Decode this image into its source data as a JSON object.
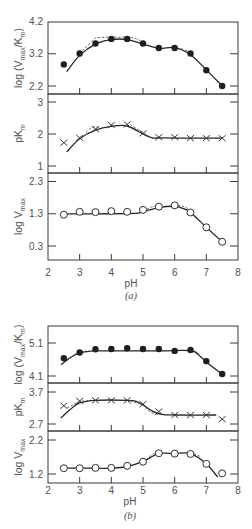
{
  "chart_data": [
    {
      "type": "line",
      "figure_label": "(a)",
      "xlabel": "pH",
      "xlim": [
        2,
        8
      ],
      "xticks": [
        2,
        3,
        4,
        5,
        6,
        7,
        8
      ],
      "grid": false,
      "x": [
        2.5,
        3,
        3.5,
        4,
        4.5,
        5,
        5.5,
        6,
        6.5,
        7,
        7.5
      ],
      "panels": [
        {
          "key": "log-vmax-km",
          "ylabel": "log (Vmax/Km)",
          "ylabel_parts": [
            [
              "log (V",
              0
            ],
            [
              "max",
              1
            ],
            [
              "/K",
              0
            ],
            [
              "m",
              1
            ],
            [
              ")",
              0
            ]
          ],
          "yticks": [
            2.2,
            3.2,
            4.2
          ],
          "marker": "filled-circle",
          "values": [
            2.87,
            3.21,
            3.52,
            3.66,
            3.66,
            3.52,
            3.38,
            3.38,
            3.21,
            2.69,
            2.2
          ],
          "fit_solid": [
            [
              2.6,
              2.66
            ],
            [
              3.0,
              3.15
            ],
            [
              3.5,
              3.5
            ],
            [
              4.0,
              3.64
            ],
            [
              4.5,
              3.64
            ],
            [
              5.0,
              3.5
            ],
            [
              5.5,
              3.37
            ],
            [
              6.0,
              3.39
            ],
            [
              6.5,
              3.17
            ],
            [
              7.0,
              2.7
            ],
            [
              7.5,
              2.2
            ]
          ],
          "fit_dashed": [
            [
              [
                3.0,
                3.2
              ],
              [
                3.4,
                3.6
              ],
              [
                3.6,
                3.7
              ],
              [
                4.5,
                3.71
              ],
              [
                4.8,
                3.66
              ],
              [
                5.0,
                3.55
              ]
            ],
            [
              [
                6.2,
                3.36
              ],
              [
                6.45,
                3.27
              ],
              [
                6.6,
                3.17
              ]
            ]
          ]
        },
        {
          "key": "pkm",
          "ylabel": "pKm",
          "ylabel_parts": [
            [
              "pK",
              0
            ],
            [
              "m",
              1
            ]
          ],
          "yticks": [
            1,
            2,
            3
          ],
          "marker": "cross",
          "values": [
            1.73,
            1.88,
            2.15,
            2.28,
            2.3,
            2.02,
            1.9,
            1.9,
            1.87,
            1.87,
            1.87
          ],
          "fit_solid": [
            [
              2.6,
              1.45
            ],
            [
              3.0,
              1.85
            ],
            [
              3.5,
              2.12
            ],
            [
              4.0,
              2.24
            ],
            [
              4.5,
              2.25
            ],
            [
              5.0,
              2.0
            ],
            [
              5.3,
              1.88
            ],
            [
              5.6,
              1.88
            ],
            [
              6.5,
              1.87
            ],
            [
              7.5,
              1.87
            ]
          ],
          "fit_dashed": [
            [
              [
                3.2,
                2.05
              ],
              [
                3.4,
                2.22
              ],
              [
                3.6,
                2.2
              ]
            ],
            [
              [
                4.6,
                2.3
              ],
              [
                4.8,
                2.16
              ],
              [
                5.0,
                2.05
              ],
              [
                5.2,
                1.92
              ],
              [
                5.35,
                1.85
              ],
              [
                5.5,
                1.88
              ]
            ]
          ]
        },
        {
          "key": "log-vmax",
          "ylabel": "log Vmax",
          "ylabel_parts": [
            [
              "log V",
              0
            ],
            [
              "max",
              1
            ]
          ],
          "yticks": [
            0.3,
            1.3,
            2.3
          ],
          "marker": "open-circle",
          "values": [
            1.27,
            1.36,
            1.35,
            1.38,
            1.36,
            1.42,
            1.52,
            1.56,
            1.34,
            0.88,
            0.43
          ],
          "fit_solid": [
            [
              2.5,
              1.3
            ],
            [
              3.5,
              1.3
            ],
            [
              4.7,
              1.31
            ],
            [
              5.0,
              1.36
            ],
            [
              5.5,
              1.49
            ],
            [
              6.0,
              1.53
            ],
            [
              6.3,
              1.45
            ],
            [
              6.5,
              1.34
            ],
            [
              7.0,
              0.88
            ],
            [
              7.5,
              0.43
            ]
          ],
          "fit_dashed": [
            [
              [
                5.0,
                1.38
              ],
              [
                5.3,
                1.52
              ],
              [
                5.6,
                1.56
              ]
            ],
            [
              [
                6.1,
                1.56
              ],
              [
                6.3,
                1.52
              ],
              [
                6.5,
                1.4
              ]
            ]
          ]
        }
      ]
    },
    {
      "type": "line",
      "figure_label": "(b)",
      "xlabel": "pH",
      "xlim": [
        2,
        8
      ],
      "xticks": [
        2,
        3,
        4,
        5,
        6,
        7,
        8
      ],
      "grid": false,
      "x": [
        2.5,
        3,
        3.5,
        4,
        4.5,
        5,
        5.5,
        6,
        6.5,
        7,
        7.5
      ],
      "panels": [
        {
          "key": "log-vmax-km",
          "ylabel": "log (Vmax/Km)",
          "ylabel_parts": [
            [
              "log (V",
              0
            ],
            [
              "max",
              1
            ],
            [
              "/K",
              0
            ],
            [
              "m",
              1
            ],
            [
              ")",
              0
            ]
          ],
          "yticks": [
            4.1,
            5.1
          ],
          "marker": "filled-circle",
          "values": [
            4.64,
            4.81,
            4.91,
            4.92,
            4.94,
            4.92,
            4.92,
            4.86,
            4.89,
            4.55,
            4.16
          ],
          "fit_solid": [
            [
              2.42,
              4.45
            ],
            [
              2.7,
              4.65
            ],
            [
              3.0,
              4.8
            ],
            [
              3.5,
              4.86
            ],
            [
              4.5,
              4.86
            ],
            [
              5.5,
              4.86
            ],
            [
              6.5,
              4.87
            ],
            [
              6.8,
              4.7
            ],
            [
              7.0,
              4.52
            ],
            [
              7.5,
              4.15
            ]
          ],
          "fit_dashed": [
            [
              [
                2.6,
                4.56
              ],
              [
                2.9,
                4.78
              ],
              [
                3.2,
                4.86
              ]
            ],
            [
              [
                6.5,
                4.89
              ],
              [
                6.7,
                4.82
              ],
              [
                6.9,
                4.62
              ]
            ]
          ]
        },
        {
          "key": "pkm",
          "ylabel": "pKm",
          "ylabel_parts": [
            [
              "pK",
              0
            ],
            [
              "m",
              1
            ]
          ],
          "yticks": [
            2.7,
            3.7
          ],
          "marker": "cross",
          "values": [
            3.27,
            3.42,
            3.44,
            3.44,
            3.44,
            3.32,
            3.09,
            2.98,
            2.98,
            2.98,
            2.85
          ],
          "fit_solid": [
            [
              2.42,
              2.9
            ],
            [
              2.7,
              3.15
            ],
            [
              3.0,
              3.36
            ],
            [
              3.5,
              3.44
            ],
            [
              4.5,
              3.44
            ],
            [
              4.8,
              3.4
            ],
            [
              5.0,
              3.3
            ],
            [
              5.3,
              3.1
            ],
            [
              5.6,
              3.0
            ],
            [
              6.0,
              2.98
            ],
            [
              7.3,
              2.98
            ]
          ],
          "fit_dashed": [
            [
              [
                2.6,
                3.2
              ],
              [
                2.8,
                3.3
              ],
              [
                3.0,
                3.4
              ],
              [
                3.3,
                3.43
              ]
            ],
            [
              [
                4.6,
                3.42
              ],
              [
                5.0,
                3.28
              ],
              [
                5.2,
                3.1
              ],
              [
                5.4,
                3.01
              ],
              [
                5.6,
                2.99
              ]
            ]
          ]
        },
        {
          "key": "log-vmax",
          "ylabel": "log Vmax",
          "ylabel_parts": [
            [
              "log V",
              0
            ],
            [
              "max",
              1
            ]
          ],
          "yticks": [
            1.2,
            2.2
          ],
          "marker": "open-circle",
          "values": [
            1.37,
            1.37,
            1.38,
            1.38,
            1.44,
            1.56,
            1.81,
            1.8,
            1.79,
            1.5,
            1.22
          ],
          "fit_solid": [
            [
              2.5,
              1.37
            ],
            [
              3.5,
              1.37
            ],
            [
              4.0,
              1.37
            ],
            [
              4.5,
              1.42
            ],
            [
              5.0,
              1.57
            ],
            [
              5.5,
              1.8
            ],
            [
              6.0,
              1.8
            ],
            [
              6.5,
              1.8
            ],
            [
              7.0,
              1.5
            ],
            [
              7.35,
              1.12
            ]
          ],
          "fit_dashed": [
            [
              [
                5.1,
                1.62
              ],
              [
                5.3,
                1.78
              ],
              [
                5.5,
                1.82
              ]
            ],
            [
              [
                6.6,
                1.8
              ],
              [
                6.8,
                1.72
              ]
            ]
          ]
        }
      ]
    }
  ]
}
